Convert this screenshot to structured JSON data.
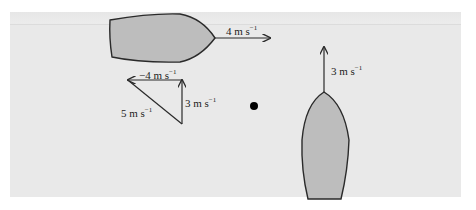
{
  "diagram": {
    "colors": {
      "panel_bg": "#e9e9e9",
      "boat_fill": "#bdbdbd",
      "stroke": "#2a2a2a",
      "dot": "#000000"
    },
    "boat_a": {
      "heading": "east",
      "velocity_label": "4 m s",
      "velocity_exp": "−1"
    },
    "boat_b": {
      "heading": "north",
      "velocity_label": "3 m s",
      "velocity_exp": "−1"
    },
    "vector_triangle": {
      "horizontal_label": "−4 m s",
      "horizontal_exp": "−1",
      "vertical_label": "3 m s",
      "vertical_exp": "−1",
      "resultant_label": "5 m s",
      "resultant_exp": "−1"
    },
    "observer_point": "dot"
  }
}
